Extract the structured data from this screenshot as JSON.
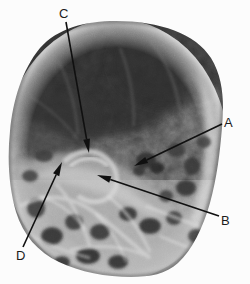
{
  "figure": {
    "kind": "annotated-radiograph",
    "width": 250,
    "height": 284,
    "background_color": "#fcfcfc",
    "film_shape": "circular",
    "modality_note": "x-ray radiograph"
  },
  "palette": {
    "background": "#fcfcfc",
    "film_darkest": "#181818",
    "film_dark": "#2e2e2e",
    "film_mid": "#6f6f6f",
    "film_light": "#b9b9b9",
    "film_brightest": "#ededed",
    "annotation_ink": "#101010",
    "label_text": "#1b1b1b"
  },
  "annotations": [
    {
      "id": "A",
      "label": "A",
      "label_x": 224,
      "label_y": 116,
      "tail_x": 222,
      "tail_y": 124,
      "tip_x": 134,
      "tip_y": 166,
      "direction": "down-left"
    },
    {
      "id": "B",
      "label": "B",
      "label_x": 221,
      "label_y": 214,
      "tail_x": 219,
      "tail_y": 216,
      "tip_x": 97,
      "tip_y": 175,
      "direction": "up-left"
    },
    {
      "id": "C",
      "label": "C",
      "label_x": 59,
      "label_y": 7,
      "tail_x": 66,
      "tail_y": 22,
      "tip_x": 89,
      "tip_y": 153,
      "direction": "down-right"
    },
    {
      "id": "D",
      "label": "D",
      "label_x": 16,
      "label_y": 249,
      "tail_x": 23,
      "tail_y": 247,
      "tip_x": 62,
      "tip_y": 162,
      "direction": "up-right"
    }
  ]
}
